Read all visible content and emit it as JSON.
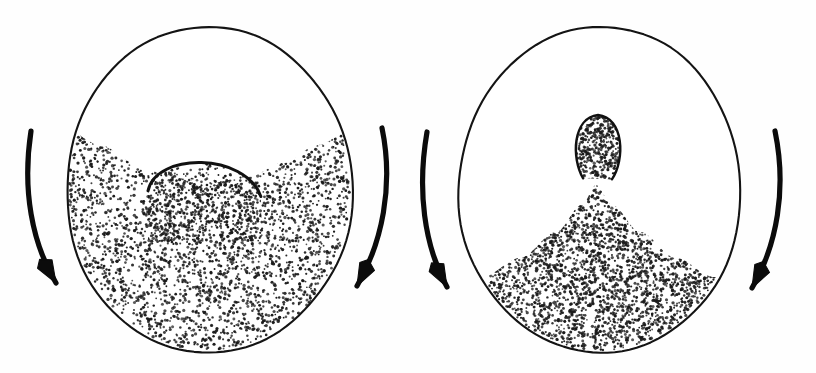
{
  "figure": {
    "background_color": "#fefefe",
    "ink_color": "#111111",
    "width": 816,
    "height": 373,
    "panel_count": 2
  },
  "chart_data": {
    "type": "diagram",
    "xlabel": "",
    "ylabel": "",
    "panels": [
      {
        "id": "left-panel",
        "name": "concave-bed-with-central-dome",
        "drum": {
          "shape": "ellipse",
          "cx": 209,
          "cy": 190,
          "rx": 143,
          "ry": 163,
          "stroke_color": "#141414",
          "stroke_width": 2.1
        },
        "fill_fraction": 0.62,
        "surface_profile": "concave",
        "surface_points": [
          [
            68,
            131
          ],
          [
            100,
            145
          ],
          [
            135,
            163
          ],
          [
            170,
            177
          ],
          [
            209,
            183
          ],
          [
            248,
            177
          ],
          [
            283,
            163
          ],
          [
            318,
            145
          ],
          [
            350,
            131
          ]
        ],
        "feature": {
          "name": "central-dome",
          "type": "arch",
          "cx": 205,
          "cy": 178,
          "rx": 57,
          "ry": 28,
          "stroke_width": 3.0
        },
        "grain_dots": 2600,
        "rotation_arrows": [
          {
            "side": "left",
            "direction": "downward",
            "sweep": "clockwise"
          },
          {
            "side": "right",
            "direction": "downward",
            "sweep": "clockwise"
          }
        ]
      },
      {
        "id": "right-panel",
        "name": "conical-heap-with-apex-bulb",
        "drum": {
          "shape": "ellipse",
          "cx": 600,
          "cy": 190,
          "rx": 141,
          "ry": 163,
          "stroke_color": "#141414",
          "stroke_width": 2.1
        },
        "fill_fraction": 0.38,
        "surface_profile": "conical-heap",
        "surface_points": [
          [
            482,
            277
          ],
          [
            520,
            258
          ],
          [
            556,
            232
          ],
          [
            582,
            205
          ],
          [
            596,
            185
          ],
          [
            612,
            205
          ],
          [
            640,
            232
          ],
          [
            676,
            258
          ],
          [
            714,
            277
          ]
        ],
        "feature": {
          "name": "apex-bulb",
          "type": "teardrop",
          "cx": 598,
          "cy": 148,
          "rx": 24,
          "ry": 33,
          "stroke_width": 2.4
        },
        "grain_dots": 2200,
        "rotation_arrows": [
          {
            "side": "left",
            "direction": "downward",
            "sweep": "clockwise"
          },
          {
            "side": "right",
            "direction": "downward",
            "sweep": "clockwise"
          }
        ]
      }
    ],
    "legend": [],
    "annotations": [],
    "grid": false
  },
  "labels": {
    "left_panel_label": "",
    "right_panel_label": "",
    "caption": ""
  }
}
